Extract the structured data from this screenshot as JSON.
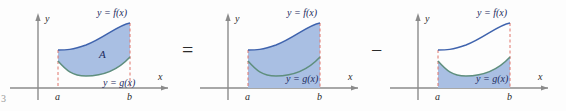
{
  "figure": {
    "number": "3",
    "panels": [
      {
        "id": "panel-1",
        "caption_f": "y = f(x)",
        "caption_g": "y = g(x)",
        "area_label": "A",
        "axis_x": "x",
        "axis_y": "y",
        "tick_a": "a",
        "tick_b": "b",
        "shaded": "between-f-and-g"
      },
      {
        "id": "panel-2",
        "caption_f": "y = f(x)",
        "caption_g": "y = g(x)",
        "area_label": "",
        "axis_x": "x",
        "axis_y": "y",
        "tick_a": "a",
        "tick_b": "b",
        "shaded": "under-f-to-axis"
      },
      {
        "id": "panel-3",
        "caption_f": "y = f(x)",
        "caption_g": "y = g(x)",
        "area_label": "",
        "axis_x": "x",
        "axis_y": "y",
        "tick_a": "a",
        "tick_b": "b",
        "shaded": "under-g-to-axis"
      }
    ],
    "operators": {
      "equals": "=",
      "minus": "−"
    },
    "colors": {
      "fill": "#a9bfe3",
      "curve_f": "#3f63ad",
      "curve_g": "#5f8f7e",
      "dashed": "#e0756b",
      "axis": "#8b8b8b",
      "label": "#1c2b5e"
    }
  }
}
